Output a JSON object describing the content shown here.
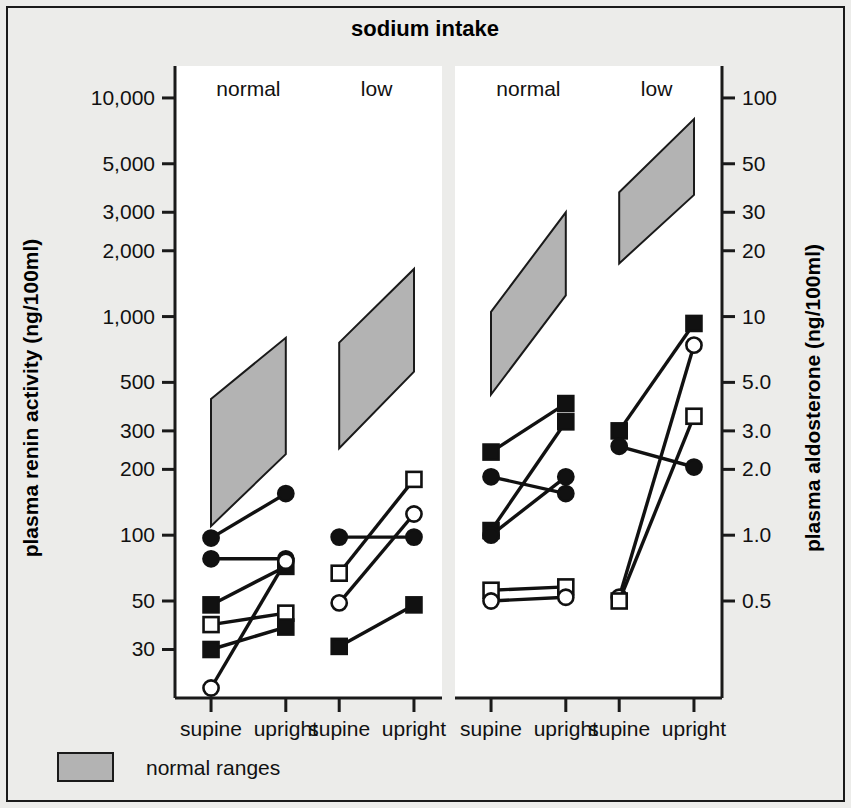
{
  "figure": {
    "title": "sodium intake",
    "background_color": "#ececea",
    "plot_background_color": "#ffffff",
    "frame_color": "#1a1a1a",
    "ink_color": "#111111",
    "range_fill_color": "#b3b3b3"
  },
  "legend": {
    "position": "bottom-left",
    "entries": [
      {
        "label": "normal ranges",
        "swatch": "#b3b3b3",
        "type": "area"
      }
    ]
  },
  "chart_data": {
    "type": "line",
    "title": "sodium intake",
    "subtitle": "",
    "grid": false,
    "legend_position": "bottom-left",
    "panels": [
      {
        "name": "plasma-renin-activity",
        "axis": "left",
        "ylabel": "plasma renin activity (ng/100ml)",
        "yscale": "log",
        "ylim": [
          18,
          14000
        ],
        "ticks": [
          {
            "value": 10000,
            "label": "10,000"
          },
          {
            "value": 5000,
            "label": "5,000"
          },
          {
            "value": 3000,
            "label": "3,000"
          },
          {
            "value": 2000,
            "label": "2,000"
          },
          {
            "value": 1000,
            "label": "1,000"
          },
          {
            "value": 500,
            "label": "500"
          },
          {
            "value": 300,
            "label": "300"
          },
          {
            "value": 200,
            "label": "200"
          },
          {
            "value": 100,
            "label": "100"
          },
          {
            "value": 50,
            "label": "50"
          },
          {
            "value": 30,
            "label": "30"
          }
        ],
        "groups": [
          {
            "label": "normal",
            "categories": [
              "supine",
              "upright"
            ]
          },
          {
            "label": "low",
            "categories": [
              "supine",
              "upright"
            ]
          }
        ],
        "categories": [
          "supine",
          "upright",
          "supine",
          "upright"
        ],
        "normal_ranges": [
          {
            "group": "normal",
            "supine_low": 110,
            "supine_high": 420,
            "upright_low": 235,
            "upright_high": 800
          },
          {
            "group": "low",
            "supine_low": 250,
            "supine_high": 760,
            "upright_low": 560,
            "upright_high": 1650
          }
        ],
        "series": [
          {
            "name": "patient-1",
            "marker": "filled-circle",
            "values": [
              97,
              155,
              null,
              null
            ]
          },
          {
            "name": "patient-2",
            "marker": "filled-circle",
            "values": [
              78,
              78,
              null,
              null
            ]
          },
          {
            "name": "patient-3",
            "marker": "filled-square",
            "values": [
              48,
              72,
              null,
              null
            ]
          },
          {
            "name": "patient-4",
            "marker": "open-square",
            "values": [
              39,
              44,
              null,
              null
            ]
          },
          {
            "name": "patient-5",
            "marker": "filled-square",
            "values": [
              30,
              38,
              null,
              null
            ]
          },
          {
            "name": "patient-6",
            "marker": "open-circle",
            "values": [
              20,
              76,
              null,
              null
            ]
          },
          {
            "name": "patient-7",
            "marker": "filled-circle",
            "values": [
              null,
              null,
              98,
              98
            ]
          },
          {
            "name": "patient-8",
            "marker": "open-square",
            "values": [
              null,
              null,
              67,
              180
            ]
          },
          {
            "name": "patient-9",
            "marker": "open-circle",
            "values": [
              null,
              null,
              49,
              125
            ]
          },
          {
            "name": "patient-10",
            "marker": "filled-square",
            "values": [
              null,
              null,
              31,
              48
            ]
          }
        ]
      },
      {
        "name": "plasma-aldosterone",
        "axis": "right",
        "ylabel": "plasma aldosterone (ng/100ml)",
        "yscale": "log",
        "ylim": [
          0.18,
          140
        ],
        "ticks": [
          {
            "value": 100,
            "label": "100"
          },
          {
            "value": 50,
            "label": "50"
          },
          {
            "value": 30,
            "label": "30"
          },
          {
            "value": 20,
            "label": "20"
          },
          {
            "value": 10,
            "label": "10"
          },
          {
            "value": 5.0,
            "label": "5.0"
          },
          {
            "value": 3.0,
            "label": "3.0"
          },
          {
            "value": 2.0,
            "label": "2.0"
          },
          {
            "value": 1.0,
            "label": "1.0"
          },
          {
            "value": 0.5,
            "label": "0.5"
          }
        ],
        "groups": [
          {
            "label": "normal",
            "categories": [
              "supine",
              "upright"
            ]
          },
          {
            "label": "low",
            "categories": [
              "supine",
              "upright"
            ]
          }
        ],
        "categories": [
          "supine",
          "upright",
          "supine",
          "upright"
        ],
        "normal_ranges": [
          {
            "group": "normal",
            "supine_low": 4.4,
            "supine_high": 10.5,
            "upright_low": 12.5,
            "upright_high": 30.0
          },
          {
            "group": "low",
            "supine_low": 17.5,
            "supine_high": 37.0,
            "upright_low": 36.0,
            "upright_high": 80.0
          }
        ],
        "series": [
          {
            "name": "patient-1",
            "marker": "filled-square",
            "values": [
              2.4,
              4.0,
              null,
              null
            ]
          },
          {
            "name": "patient-2",
            "marker": "filled-square",
            "values": [
              1.05,
              3.3,
              null,
              null
            ]
          },
          {
            "name": "patient-3",
            "marker": "filled-circle",
            "values": [
              1.85,
              1.55,
              null,
              null
            ]
          },
          {
            "name": "patient-4",
            "marker": "filled-circle",
            "values": [
              1.0,
              1.85,
              null,
              null
            ]
          },
          {
            "name": "patient-5",
            "marker": "open-square",
            "values": [
              0.56,
              0.58,
              null,
              null
            ]
          },
          {
            "name": "patient-6",
            "marker": "open-circle",
            "values": [
              0.5,
              0.52,
              null,
              null
            ]
          },
          {
            "name": "patient-7",
            "marker": "filled-square",
            "values": [
              null,
              null,
              3.0,
              9.3
            ]
          },
          {
            "name": "patient-8",
            "marker": "filled-circle",
            "values": [
              null,
              null,
              2.55,
              2.05
            ]
          },
          {
            "name": "patient-9",
            "marker": "open-circle",
            "values": [
              null,
              null,
              0.52,
              7.4
            ]
          },
          {
            "name": "patient-10",
            "marker": "open-square",
            "values": [
              null,
              null,
              0.5,
              3.5
            ]
          }
        ]
      }
    ]
  }
}
